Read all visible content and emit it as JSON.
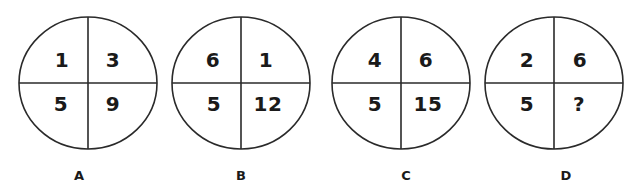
{
  "puzzle": {
    "stroke_color": "#2a2a2a",
    "text_color": "#1a1a1a",
    "circles": [
      {
        "label": "A",
        "cx": 88,
        "cy": 83,
        "rx": 69,
        "ry": 66,
        "top_left": "1",
        "top_right": "3",
        "bottom_left": "5",
        "bottom_right": "9",
        "label_x": 79
      },
      {
        "label": "B",
        "cx": 241,
        "cy": 83,
        "rx": 69,
        "ry": 66,
        "top_left": "6",
        "top_right": "1",
        "bottom_left": "5",
        "bottom_right": "12",
        "label_x": 241
      },
      {
        "label": "C",
        "cx": 401,
        "cy": 83,
        "rx": 69,
        "ry": 66,
        "top_left": "4",
        "top_right": "6",
        "bottom_left": "5",
        "bottom_right": "15",
        "label_x": 406
      },
      {
        "label": "D",
        "cx": 554,
        "cy": 83,
        "rx": 69,
        "ry": 66,
        "top_left": "2",
        "top_right": "6",
        "bottom_left": "5",
        "bottom_right": "?",
        "label_x": 566
      }
    ]
  }
}
